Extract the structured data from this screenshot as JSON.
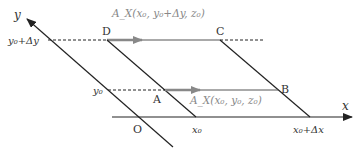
{
  "diagram": {
    "axes": {
      "x_label": "x",
      "y_label": "y",
      "origin_label": "O"
    },
    "tick_labels": {
      "x0": "x₀",
      "x0_dx": "x₀+Δx",
      "y0": "y₀",
      "y0_dy": "y₀+Δy"
    },
    "points": {
      "A": "A",
      "B": "B",
      "C": "C",
      "D": "D"
    },
    "vectors": {
      "top": "A_X(x₀, y₀+Δy, z₀)",
      "bottom": "A_X(x₀, y₀, z₀)"
    },
    "colors": {
      "line": "#222222",
      "arrow": "#8a8a8a",
      "text": "#333333",
      "vector_text": "#888888"
    }
  }
}
